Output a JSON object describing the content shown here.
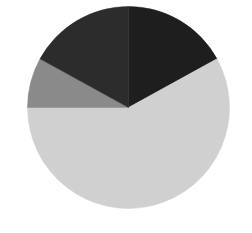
{
  "chart_data": {
    "type": "pie",
    "title": "",
    "start_angle_deg": 0,
    "direction": "clockwise",
    "center": [
      128.5,
      107.5
    ],
    "radius": 101,
    "slices": [
      {
        "label": "",
        "value": 17,
        "color": "#1e1e1e"
      },
      {
        "label": "",
        "value": 58,
        "color": "#d0d0d0"
      },
      {
        "label": "",
        "value": 8,
        "color": "#8a8a8a"
      },
      {
        "label": "",
        "value": 17,
        "color": "#2c2c2c"
      }
    ],
    "categories": [
      "Slice 1",
      "Slice 2",
      "Slice 3",
      "Slice 4"
    ],
    "values": [
      17,
      58,
      8,
      17
    ],
    "legend": "none",
    "labels_visible": false
  },
  "background": "#ffffff"
}
